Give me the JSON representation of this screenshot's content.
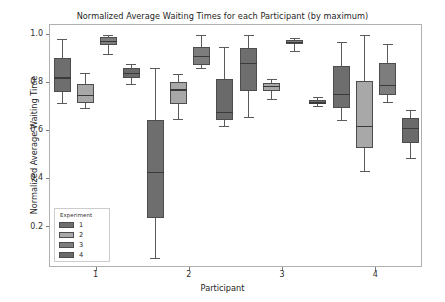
{
  "chart_data": {
    "type": "box",
    "title": "Normalized Average Waiting Times for each Participant (by maximum)",
    "xlabel": "Participant",
    "ylabel": "Normalized Average Waiting Time",
    "categories": [
      "1",
      "2",
      "3",
      "4"
    ],
    "xticklabels": [
      "1",
      "2",
      "3",
      "4"
    ],
    "yticklabels": [
      "1.0",
      "0.8",
      "0.6",
      "0.4",
      "0.2"
    ],
    "ytickvalues": [
      1.0,
      0.8,
      0.6,
      0.4,
      0.2
    ],
    "ylim": [
      0.03,
      1.04
    ],
    "grid": false,
    "legend": {
      "title": "Experiment",
      "position": "lower left",
      "entries": [
        {
          "label": "1",
          "color": "#6e6e6e"
        },
        {
          "label": "2",
          "color": "#a8a8a8"
        },
        {
          "label": "3",
          "color": "#7d7d7d"
        },
        {
          "label": "4",
          "color": "#6a6a6a"
        }
      ]
    },
    "series": [
      {
        "name": "1",
        "color": "#6e6e6e",
        "boxes": [
          {
            "participant": "1",
            "whisker_low": 0.715,
            "q1": 0.762,
            "median": 0.822,
            "q3": 0.903,
            "whisker_high": 0.982
          },
          {
            "participant": "2",
            "whisker_low": 0.073,
            "q1": 0.239,
            "median": 0.428,
            "q3": 0.646,
            "whisker_high": 0.862
          },
          {
            "participant": "3",
            "whisker_low": 0.657,
            "q1": 0.766,
            "median": 0.881,
            "q3": 0.944,
            "whisker_high": 1.0
          },
          {
            "participant": "4",
            "whisker_low": 0.645,
            "q1": 0.697,
            "median": 0.753,
            "q3": 0.869,
            "whisker_high": 0.968
          }
        ]
      },
      {
        "name": "2",
        "color": "#a8a8a8",
        "boxes": [
          {
            "participant": "1",
            "whisker_low": 0.697,
            "q1": 0.714,
            "median": 0.749,
            "q3": 0.793,
            "whisker_high": 0.84
          },
          {
            "participant": "2",
            "whisker_low": 0.649,
            "q1": 0.71,
            "median": 0.772,
            "q3": 0.803,
            "whisker_high": 0.836
          },
          {
            "participant": "3",
            "whisker_low": 0.731,
            "q1": 0.766,
            "median": 0.787,
            "q3": 0.799,
            "whisker_high": 0.817
          },
          {
            "participant": "4",
            "whisker_low": 0.435,
            "q1": 0.529,
            "median": 0.619,
            "q3": 0.809,
            "whisker_high": 1.0
          }
        ]
      },
      {
        "name": "3",
        "color": "#7d7d7d",
        "boxes": [
          {
            "participant": "1",
            "whisker_low": 0.918,
            "q1": 0.958,
            "median": 0.973,
            "q3": 0.989,
            "whisker_high": 1.0
          },
          {
            "participant": "2",
            "whisker_low": 0.861,
            "q1": 0.873,
            "median": 0.91,
            "q3": 0.95,
            "whisker_high": 1.0
          },
          {
            "participant": "3",
            "whisker_low": 0.933,
            "q1": 0.962,
            "median": 0.97,
            "q3": 0.978,
            "whisker_high": 0.985
          },
          {
            "participant": "4",
            "whisker_low": 0.719,
            "q1": 0.75,
            "median": 0.79,
            "q3": 0.88,
            "whisker_high": 0.962
          }
        ]
      },
      {
        "name": "4",
        "color": "#6a6a6a",
        "boxes": [
          {
            "participant": "1",
            "whisker_low": 0.793,
            "q1": 0.82,
            "median": 0.84,
            "q3": 0.862,
            "whisker_high": 0.878
          },
          {
            "participant": "2",
            "whisker_low": 0.619,
            "q1": 0.645,
            "median": 0.678,
            "q3": 0.815,
            "whisker_high": 0.949
          },
          {
            "participant": "3",
            "whisker_low": 0.705,
            "q1": 0.71,
            "median": 0.718,
            "q3": 0.728,
            "whisker_high": 0.74
          },
          {
            "participant": "4",
            "whisker_low": 0.487,
            "q1": 0.55,
            "median": 0.611,
            "q3": 0.652,
            "whisker_high": 0.685
          }
        ]
      }
    ]
  }
}
